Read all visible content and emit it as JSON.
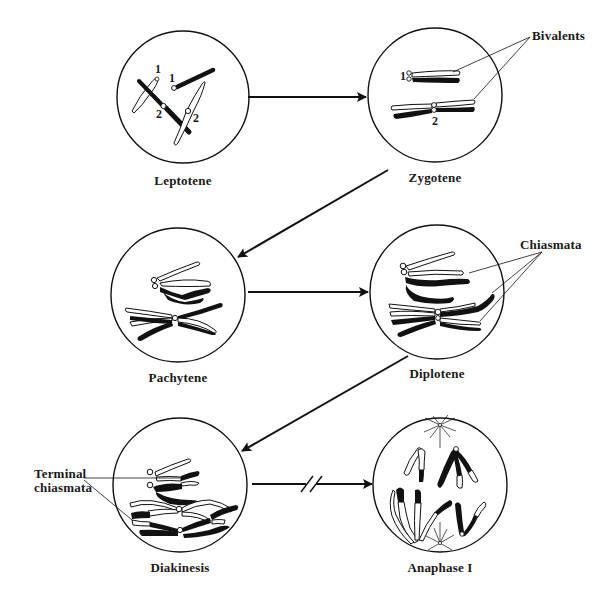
{
  "diagram": {
    "stages": [
      {
        "id": "leptotene",
        "label": "Leptotene",
        "cx": 183,
        "cy": 97,
        "r": 66
      },
      {
        "id": "zygotene",
        "label": "Zygotene",
        "cx": 435,
        "cy": 95,
        "r": 67
      },
      {
        "id": "pachytene",
        "label": "Pachytene",
        "cx": 178,
        "cy": 295,
        "r": 67
      },
      {
        "id": "diplotene",
        "label": "Diplotene",
        "cx": 437,
        "cy": 292,
        "r": 67
      },
      {
        "id": "diakinesis",
        "label": "Diakinesis",
        "cx": 180,
        "cy": 485,
        "r": 67
      },
      {
        "id": "anaphase-1",
        "label": "Anaphase I",
        "cx": 440,
        "cy": 485,
        "r": 67
      }
    ],
    "annotations": {
      "bivalents": "Bivalents",
      "chiasmata": "Chiasmata",
      "terminal_chiasmata_line1": "Terminal",
      "terminal_chiasmata_line2": "chiasmata"
    },
    "chromosome_numbers": {
      "lepto_1a": "1",
      "lepto_1b": "1",
      "lepto_2a": "2",
      "lepto_2b": "2",
      "zygo_1": "1",
      "zygo_2": "2"
    },
    "arrows": [
      {
        "from": "leptotene",
        "to": "zygotene",
        "type": "horizontal"
      },
      {
        "from": "zygotene",
        "to": "pachytene",
        "type": "diagonal"
      },
      {
        "from": "pachytene",
        "to": "diplotene",
        "type": "horizontal"
      },
      {
        "from": "diplotene",
        "to": "diakinesis",
        "type": "diagonal"
      },
      {
        "from": "diakinesis",
        "to": "anaphase-1",
        "type": "horizontal-broken"
      }
    ],
    "colors": {
      "ink": "#111111",
      "background": "#ffffff"
    }
  }
}
